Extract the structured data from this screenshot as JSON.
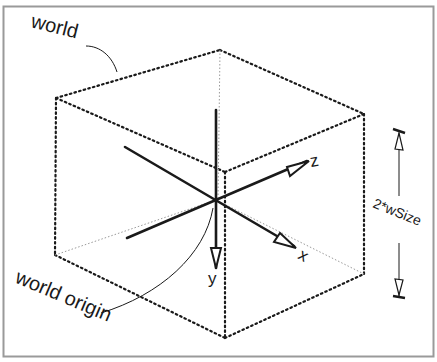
{
  "diagram": {
    "labels": {
      "world": "world",
      "world_origin": "world origin",
      "x_axis": "x",
      "y_axis": "y",
      "z_axis": "z",
      "dimension": "2*wSize"
    },
    "colors": {
      "background": "#ffffff",
      "border": "#9a9a9a",
      "line": "#1a1a1a",
      "hidden_edge": "#9a9a9a"
    }
  }
}
